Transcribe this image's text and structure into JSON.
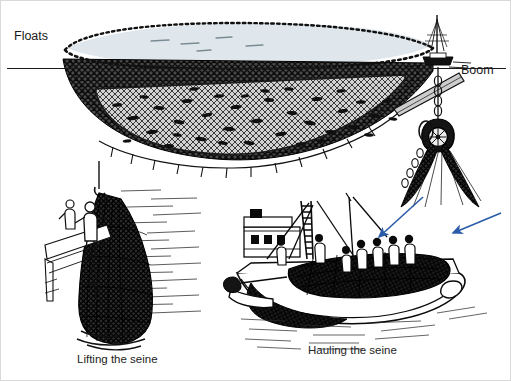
{
  "figure": {
    "kind": "technical-illustration",
    "background_color": "#ffffff",
    "border_color": "#d9d9d9",
    "ink_color": "#111111",
    "arrow_color": "#2b5ca8",
    "water_fill": "#dfe7ec",
    "net_shadow_fill": "#3a3a3a",
    "net_light_fill": "#c9c9c9"
  },
  "labels": {
    "floats": "Floats",
    "boom": "Boom"
  },
  "captions": {
    "lifting": "Lifting the seine",
    "hauling": "Hauling the seine"
  },
  "panels": [
    {
      "id": "seine-underwater",
      "title": "Floats",
      "description": "Purse seine net suspended below the waterline with float line across the top, dark outer mesh wall, lighter inner mesh and fish trapped inside"
    },
    {
      "id": "lifting-the-seine",
      "title": "Lifting the seine",
      "description": "Two fishermen on a deck hauling a dripping seine net out of the water"
    },
    {
      "id": "hauling-the-seine",
      "title": "Hauling the seine",
      "description": "Crew aboard a seiner pulling the loaded net aboard, boom and pulley block overhead"
    }
  ],
  "annotations": [
    {
      "name": "arrow-to-crew",
      "color": "#2b5ca8",
      "points_to": "crew hauling net"
    },
    {
      "name": "arrow-to-net-bundle",
      "color": "#2b5ca8",
      "points_to": "net bundle on deck"
    }
  ],
  "elements": {
    "waterline": "horizontal sea surface line",
    "float_line": "dotted line of corks along the top edge of the net",
    "pulley_block": "block and tackle hanging from the boom",
    "catch_boat": "small vessel at the surface beside the float line",
    "fish_count_visible": 38
  }
}
